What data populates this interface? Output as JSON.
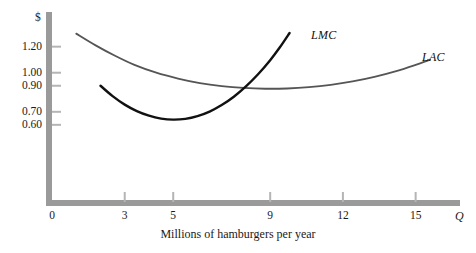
{
  "chart_data": {
    "type": "line",
    "title": "",
    "xlabel": "Millions of hamburgers per year",
    "ylabel": "$",
    "xlim": [
      0,
      16.5
    ],
    "ylim": [
      0,
      1.42
    ],
    "grid": false,
    "legend_position": "inline-curve-labels",
    "x_ticks": [
      {
        "value": 0,
        "label": "0"
      },
      {
        "value": 3,
        "label": "3"
      },
      {
        "value": 5,
        "label": "5"
      },
      {
        "value": 9,
        "label": "9"
      },
      {
        "value": 12,
        "label": "12"
      },
      {
        "value": 15,
        "label": "15"
      }
    ],
    "y_ticks": [
      {
        "value": 1.2,
        "label": "1.20"
      },
      {
        "value": 1.0,
        "label": "1.00"
      },
      {
        "value": 0.9,
        "label": "0.90"
      },
      {
        "value": 0.7,
        "label": "0.70"
      },
      {
        "value": 0.6,
        "label": "0.60"
      }
    ],
    "x_axis_symbol": "Q",
    "y_axis_symbol": "$",
    "series": [
      {
        "name": "LAC",
        "label": "LAC",
        "color": "#555555",
        "width": 1.8,
        "points": [
          [
            1.0,
            1.3
          ],
          [
            1.8,
            1.21
          ],
          [
            2.6,
            1.13
          ],
          [
            3.4,
            1.06
          ],
          [
            4.3,
            1.0
          ],
          [
            5.2,
            0.955
          ],
          [
            6.1,
            0.92
          ],
          [
            7.0,
            0.897
          ],
          [
            7.9,
            0.883
          ],
          [
            8.8,
            0.877
          ],
          [
            9.7,
            0.879
          ],
          [
            10.6,
            0.889
          ],
          [
            11.5,
            0.907
          ],
          [
            12.4,
            0.933
          ],
          [
            13.3,
            0.968
          ],
          [
            14.2,
            1.012
          ],
          [
            15.0,
            1.06
          ],
          [
            15.6,
            1.1
          ]
        ]
      },
      {
        "name": "LMC",
        "label": "LMC",
        "color": "#111111",
        "width": 2.4,
        "points": [
          [
            2.0,
            0.9
          ],
          [
            2.5,
            0.82
          ],
          [
            3.0,
            0.755
          ],
          [
            3.5,
            0.705
          ],
          [
            4.0,
            0.67
          ],
          [
            4.5,
            0.648
          ],
          [
            5.0,
            0.64
          ],
          [
            5.5,
            0.646
          ],
          [
            6.0,
            0.667
          ],
          [
            6.5,
            0.702
          ],
          [
            7.0,
            0.752
          ],
          [
            7.5,
            0.816
          ],
          [
            8.0,
            0.895
          ],
          [
            8.5,
            0.988
          ],
          [
            9.0,
            1.096
          ],
          [
            9.4,
            1.195
          ],
          [
            9.8,
            1.305
          ]
        ]
      }
    ],
    "annotations": [
      {
        "name": "intersection",
        "description": "LMC crosses LAC at minimum of LAC",
        "x": 8.95,
        "y": 0.878
      }
    ]
  },
  "axes": {
    "y_axis_color": "#9a9a9a",
    "x_axis_color": "#9a9a9a",
    "tick_color": "#b5b5b5"
  }
}
